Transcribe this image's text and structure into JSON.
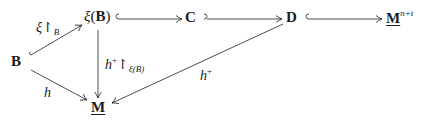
{
  "diagram": {
    "nodes": {
      "B": "B",
      "xiB": {
        "fn": "ξ",
        "arg": "B"
      },
      "C": "C",
      "D": "D",
      "Mnt": {
        "base": "M",
        "sup": "n+t"
      },
      "M": "M"
    },
    "edges": [
      {
        "from": "B",
        "to": "ξ(B)",
        "label": "ξ↾B",
        "style": "hook"
      },
      {
        "from": "ξ(B)",
        "to": "C",
        "label": "",
        "style": "hook"
      },
      {
        "from": "C",
        "to": "D",
        "label": "",
        "style": "hook"
      },
      {
        "from": "D",
        "to": "M^{n+t}",
        "label": "",
        "style": "hook"
      },
      {
        "from": "ξ(B)",
        "to": "M",
        "label": "h⁺↾ξ(B)",
        "style": "arrow"
      },
      {
        "from": "B",
        "to": "M",
        "label": "h",
        "style": "arrow"
      },
      {
        "from": "D",
        "to": "M",
        "label": "h⁺",
        "style": "arrow"
      }
    ],
    "labels": {
      "xi_restrict_B": {
        "main": "ξ↾",
        "sub": "B"
      },
      "h_plus_restrict": {
        "main": "h",
        "sup": "+",
        "restrict": "↾",
        "sub": "ξ(B)"
      },
      "h": "h",
      "h_plus": {
        "main": "h",
        "sup": "+"
      }
    }
  }
}
